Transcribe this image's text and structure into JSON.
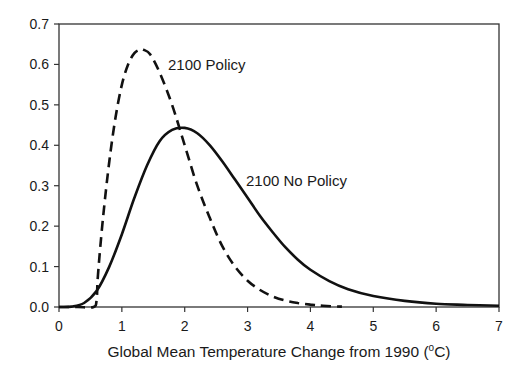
{
  "chart_data": {
    "type": "line",
    "title": "",
    "xlabel": "Global Mean Temperature Change from 1990 (°C)",
    "xlabel_parts": {
      "prefix": "Global Mean Temperature Change from 1990 (",
      "superscript": "o",
      "suffix": "C)"
    },
    "ylabel": "",
    "xlim": [
      0,
      7
    ],
    "ylim": [
      0,
      0.7
    ],
    "grid": false,
    "legend": "none (inline annotations)",
    "x_ticks": [
      "0",
      "1",
      "2",
      "3",
      "4",
      "5",
      "6",
      "7"
    ],
    "y_ticks": [
      "0.0",
      "0.1",
      "0.2",
      "0.3",
      "0.4",
      "0.5",
      "0.6",
      "0.7"
    ],
    "series": [
      {
        "name": "2100 Policy",
        "style": "dashed",
        "x": [
          0.0,
          0.3,
          0.55,
          0.6,
          0.62,
          0.7,
          0.8,
          0.9,
          1.0,
          1.1,
          1.2,
          1.3,
          1.35,
          1.45,
          1.6,
          1.8,
          2.0,
          2.2,
          2.4,
          2.6,
          2.8,
          3.0,
          3.2,
          3.4,
          3.6,
          3.8,
          4.0,
          4.2,
          4.5
        ],
        "values": [
          0.0,
          0.0,
          0.0,
          0.02,
          0.08,
          0.22,
          0.36,
          0.47,
          0.55,
          0.6,
          0.628,
          0.637,
          0.636,
          0.625,
          0.58,
          0.5,
          0.4,
          0.3,
          0.22,
          0.15,
          0.1,
          0.065,
          0.042,
          0.026,
          0.016,
          0.01,
          0.006,
          0.003,
          0.001
        ]
      },
      {
        "name": "2100 No Policy",
        "style": "solid",
        "x": [
          0.0,
          0.2,
          0.4,
          0.6,
          0.8,
          1.0,
          1.2,
          1.4,
          1.6,
          1.8,
          2.0,
          2.2,
          2.4,
          2.6,
          2.8,
          3.0,
          3.2,
          3.4,
          3.6,
          3.8,
          4.0,
          4.3,
          4.6,
          5.0,
          5.5,
          6.0,
          6.5,
          7.0
        ],
        "values": [
          0.0,
          0.001,
          0.01,
          0.04,
          0.1,
          0.18,
          0.27,
          0.35,
          0.41,
          0.438,
          0.443,
          0.43,
          0.4,
          0.36,
          0.315,
          0.27,
          0.225,
          0.185,
          0.148,
          0.117,
          0.092,
          0.064,
          0.044,
          0.027,
          0.015,
          0.008,
          0.005,
          0.003
        ]
      }
    ],
    "annotations": [
      {
        "text": "2100 Policy",
        "x": 1.85,
        "y": 0.6
      },
      {
        "text": "2100 No Policy",
        "x": 2.95,
        "y": 0.32
      }
    ]
  },
  "labels": {
    "policy": "2100 Policy",
    "no_policy": "2100 No Policy"
  }
}
